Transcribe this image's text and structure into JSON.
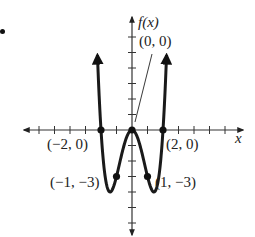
{
  "figure": {
    "function": "f(x) = x^4 - 4x^2",
    "y_axis_label": "f(x)",
    "x_axis_label": "x",
    "points": [
      {
        "label": "(−2, 0)",
        "x": -2,
        "y": 0
      },
      {
        "label": "(0, 0)",
        "x": 0,
        "y": 0
      },
      {
        "label": "(2, 0)",
        "x": 2,
        "y": 0
      },
      {
        "label": "(−1, −3)",
        "x": -1,
        "y": -3
      },
      {
        "label": "(1, −3)",
        "x": 1,
        "y": -3
      }
    ],
    "x_ticks": 14,
    "y_ticks": 14,
    "colors": {
      "curve": "#1a1a1a",
      "axes": "#333333",
      "background": "#ffffff"
    }
  }
}
